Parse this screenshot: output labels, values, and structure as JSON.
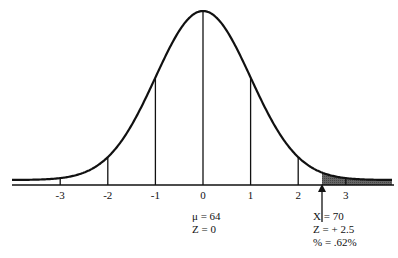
{
  "chart_data": {
    "type": "area",
    "title": "",
    "xlabel": "",
    "ylabel": "",
    "curve": "standard normal distribution",
    "x_ticks": [
      "-3",
      "-2",
      "-1",
      "0",
      "1",
      "2",
      "3"
    ],
    "shaded_region": {
      "from_z": 2.5,
      "to_z": "right tail",
      "color": "#555555"
    },
    "marker": {
      "z": 2.5
    },
    "annotations": {
      "mean": [
        "μ = 64",
        "Z = 0"
      ],
      "point": [
        "X = 70",
        "Z = + 2.5",
        "% = .62%"
      ]
    },
    "grid": false
  },
  "ticks": [
    "-3",
    "-2",
    "-1",
    "0",
    "1",
    "2",
    "3"
  ],
  "mean_label": {
    "line1": "μ = 64",
    "line2": "Z = 0"
  },
  "point_label": {
    "line1": "X = 70",
    "line2": "Z = + 2.5",
    "line3": "% = .62%"
  }
}
